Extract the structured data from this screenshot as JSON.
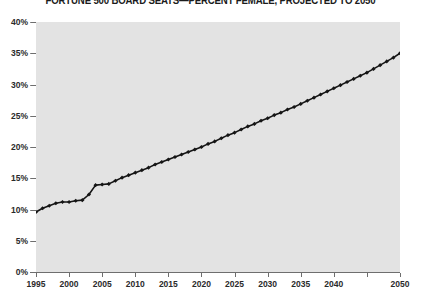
{
  "chart_data": {
    "type": "line",
    "title": "FORTUNE 500 BOARD SEATS—PERCENT FEMALE, PROJECTED TO 2050",
    "xlabel": "",
    "ylabel": "",
    "xlim": [
      1995,
      2050
    ],
    "ylim": [
      0,
      40
    ],
    "grid": "horizontal",
    "legend": "none",
    "marker": "diamond",
    "line_color": "#151515",
    "plot_background": "#e3e3e3",
    "page_background": "#ffffff",
    "gridline_color": "#8d8d8d",
    "y_ticks": [
      0,
      5,
      10,
      15,
      20,
      25,
      30,
      35,
      40
    ],
    "y_tick_labels": [
      "0%",
      "5%",
      "10%",
      "15%",
      "20%",
      "25%",
      "30%",
      "35%",
      "40%"
    ],
    "x_ticks": [
      1995,
      2000,
      2005,
      2010,
      2015,
      2020,
      2025,
      2030,
      2035,
      2040,
      2045,
      2050
    ],
    "x_tick_labels": [
      "1995",
      "2000",
      "2005",
      "2010",
      "2015",
      "2020",
      "2025",
      "2030",
      "2035",
      "2040",
      "",
      "2050"
    ],
    "series": [
      {
        "name": "Percent female board seats",
        "x": [
          1995,
          1996,
          1997,
          1998,
          1999,
          2000,
          2001,
          2002,
          2003,
          2004,
          2005,
          2006,
          2007,
          2008,
          2009,
          2010,
          2011,
          2012,
          2013,
          2014,
          2015,
          2016,
          2017,
          2018,
          2019,
          2020,
          2021,
          2022,
          2023,
          2024,
          2025,
          2026,
          2027,
          2028,
          2029,
          2030,
          2031,
          2032,
          2033,
          2034,
          2035,
          2036,
          2037,
          2038,
          2039,
          2040,
          2041,
          2042,
          2043,
          2044,
          2045,
          2046,
          2047,
          2048,
          2049,
          2050
        ],
        "values": [
          9.6,
          10.2,
          10.6,
          11.0,
          11.2,
          11.2,
          11.4,
          11.5,
          12.4,
          13.9,
          14.0,
          14.1,
          14.6,
          15.1,
          15.5,
          15.9,
          16.3,
          16.7,
          17.2,
          17.6,
          18.0,
          18.4,
          18.8,
          19.2,
          19.6,
          20.0,
          20.5,
          20.9,
          21.4,
          21.9,
          22.3,
          22.8,
          23.3,
          23.7,
          24.2,
          24.6,
          25.1,
          25.5,
          26.0,
          26.4,
          26.9,
          27.4,
          27.9,
          28.4,
          28.9,
          29.4,
          29.9,
          30.4,
          30.9,
          31.4,
          31.9,
          32.5,
          33.1,
          33.7,
          34.3,
          35.0
        ]
      }
    ]
  }
}
